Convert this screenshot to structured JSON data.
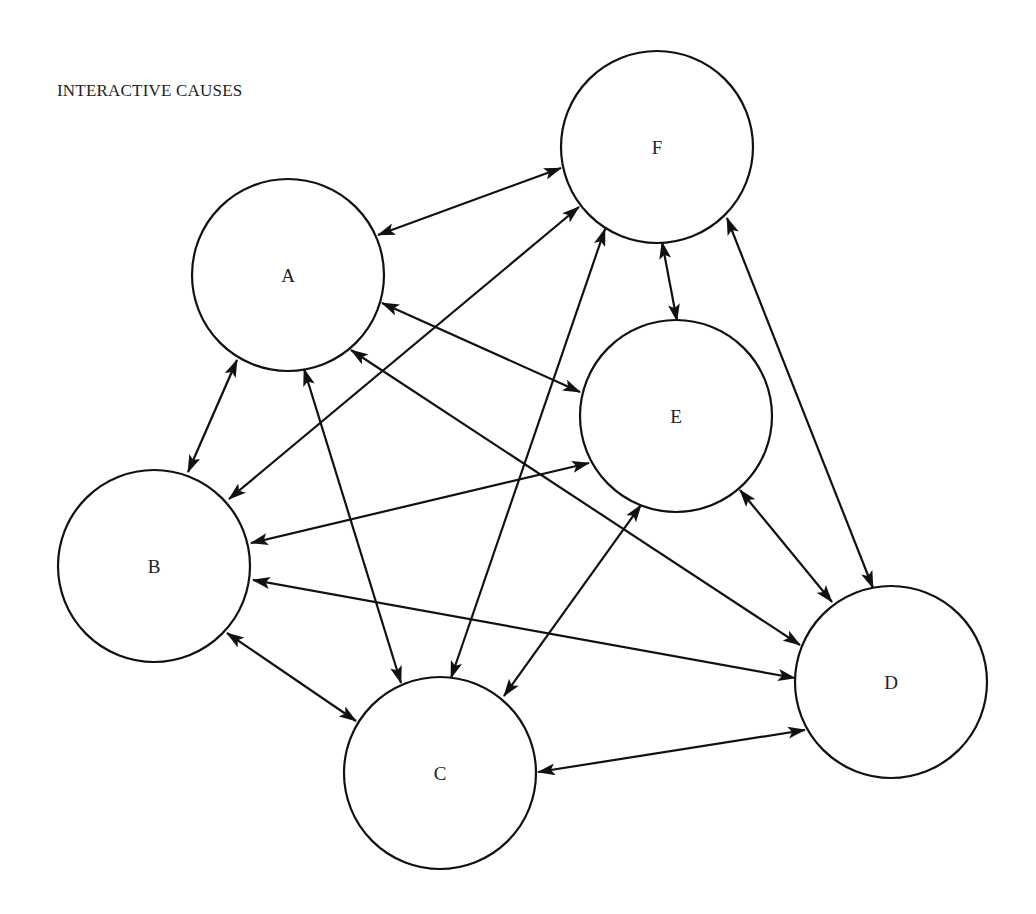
{
  "title": "INTERACTIVE CAUSES",
  "colors": {
    "stroke": "#111111",
    "background": "#ffffff",
    "text": "#222222"
  },
  "nodes": [
    {
      "id": "A",
      "label": "A",
      "cx": 288,
      "cy": 275,
      "r": 96
    },
    {
      "id": "B",
      "label": "B",
      "cx": 154,
      "cy": 566,
      "r": 96
    },
    {
      "id": "C",
      "label": "C",
      "cx": 440,
      "cy": 773,
      "r": 96
    },
    {
      "id": "D",
      "label": "D",
      "cx": 891,
      "cy": 682,
      "r": 96
    },
    {
      "id": "E",
      "label": "E",
      "cx": 676,
      "cy": 416,
      "r": 96
    },
    {
      "id": "F",
      "label": "F",
      "cx": 657,
      "cy": 147,
      "r": 96
    }
  ],
  "edges": [
    {
      "from": "A",
      "to": "F",
      "bidirectional": true,
      "x1": 378,
      "y1": 235,
      "x2": 561,
      "y2": 168
    },
    {
      "from": "A",
      "to": "E",
      "bidirectional": true,
      "x1": 382,
      "y1": 303,
      "x2": 580,
      "y2": 392
    },
    {
      "from": "A",
      "to": "B",
      "bidirectional": true,
      "x1": 237,
      "y1": 360,
      "x2": 188,
      "y2": 472
    },
    {
      "from": "A",
      "to": "C",
      "bidirectional": true,
      "x1": 304,
      "y1": 369,
      "x2": 401,
      "y2": 683
    },
    {
      "from": "A",
      "to": "D",
      "bidirectional": true,
      "x1": 351,
      "y1": 350,
      "x2": 800,
      "y2": 645
    },
    {
      "from": "B",
      "to": "F",
      "bidirectional": true,
      "x1": 229,
      "y1": 499,
      "x2": 579,
      "y2": 207
    },
    {
      "from": "B",
      "to": "E",
      "bidirectional": true,
      "x1": 251,
      "y1": 543,
      "x2": 589,
      "y2": 463
    },
    {
      "from": "B",
      "to": "D",
      "bidirectional": true,
      "x1": 253,
      "y1": 580,
      "x2": 795,
      "y2": 678
    },
    {
      "from": "B",
      "to": "C",
      "bidirectional": true,
      "x1": 227,
      "y1": 633,
      "x2": 356,
      "y2": 721
    },
    {
      "from": "C",
      "to": "F",
      "bidirectional": true,
      "x1": 451,
      "y1": 678,
      "x2": 605,
      "y2": 229
    },
    {
      "from": "C",
      "to": "E",
      "bidirectional": true,
      "x1": 504,
      "y1": 696,
      "x2": 641,
      "y2": 505
    },
    {
      "from": "C",
      "to": "D",
      "bidirectional": true,
      "x1": 538,
      "y1": 772,
      "x2": 805,
      "y2": 730
    },
    {
      "from": "F",
      "to": "E",
      "bidirectional": true,
      "x1": 662,
      "y1": 242,
      "x2": 677,
      "y2": 321
    },
    {
      "from": "F",
      "to": "D",
      "bidirectional": true,
      "x1": 727,
      "y1": 218,
      "x2": 873,
      "y2": 588
    },
    {
      "from": "E",
      "to": "D",
      "bidirectional": true,
      "x1": 740,
      "y1": 490,
      "x2": 832,
      "y2": 602
    }
  ]
}
